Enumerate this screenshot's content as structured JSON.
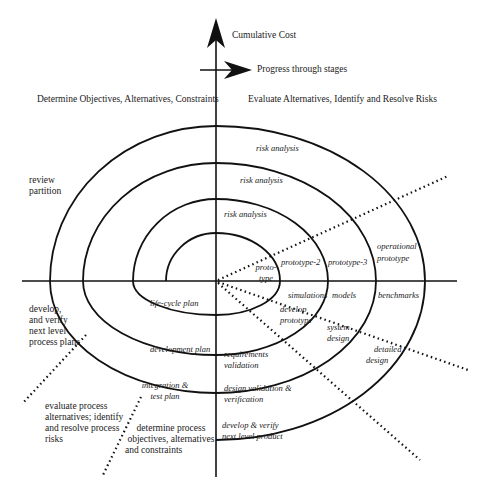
{
  "diagram": {
    "type": "spiral-model",
    "axes": {
      "vertical_label": "Cumulative Cost",
      "horizontal_label": "Progress through stages"
    },
    "quadrants": {
      "top_left": "Determine Objectives, Alternatives, Constraints",
      "top_right": "Evaluate Alternatives, Identify and Resolve Risks"
    },
    "outer_labels": {
      "review": [
        "review",
        "partition"
      ],
      "develop_plans": [
        "develop,",
        "and verify",
        "next level",
        "process plans"
      ],
      "evaluate_process": [
        "evaluate process",
        "alternatives; identify",
        "and resolve process",
        "risks"
      ],
      "determine_process": [
        "determine process",
        "objectives, alternatives",
        "and constraints"
      ]
    },
    "risk_analysis": [
      "risk analysis",
      "risk analysis",
      "risk analysis"
    ],
    "prototypes": {
      "p1": [
        "proto-",
        "type"
      ],
      "p2": "prototype-2",
      "p3": "prototype-3",
      "operational": [
        "operational",
        "prototype"
      ]
    },
    "simulations": {
      "simulations": "simulations",
      "models": "models",
      "benchmarks": "benchmarks"
    },
    "develop_stage": {
      "develop_prototype": [
        "develop",
        "prototype"
      ],
      "system_design": [
        "system",
        "design"
      ],
      "detailed_design": [
        "detailed",
        "design"
      ]
    },
    "validation": {
      "requirements": [
        "requirements",
        "validation"
      ],
      "design": [
        "design validation &",
        "verification"
      ],
      "product": [
        "develop & verify",
        "next level product"
      ]
    },
    "plans": {
      "life_cycle": "life-cycle plan",
      "development": "development plan",
      "integration": [
        "integration &",
        "test plan"
      ]
    },
    "colors": {
      "line": "#111111",
      "background": "#ffffff"
    }
  }
}
